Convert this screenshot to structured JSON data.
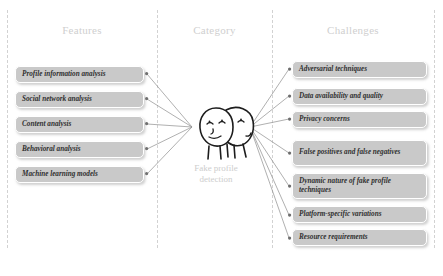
{
  "columns": [
    {
      "id": "features",
      "label": "Features"
    },
    {
      "id": "category",
      "label": "Category"
    },
    {
      "id": "challenges",
      "label": "Challenges"
    }
  ],
  "center": {
    "icon": "two-faces-mask-icon",
    "caption_line1": "Fake profile",
    "caption_line2": "detection",
    "caption": "Fake profile detection"
  },
  "features": [
    {
      "label": "Profile information analysis"
    },
    {
      "label": "Social network analysis"
    },
    {
      "label": "Content analysis"
    },
    {
      "label": "Behavioral analysis"
    },
    {
      "label": "Machine learning models"
    }
  ],
  "challenges": [
    {
      "label": "Adversarial techniques"
    },
    {
      "label": "Data availability and quality"
    },
    {
      "label": "Privacy concerns"
    },
    {
      "label": "False positives and false negatives"
    },
    {
      "label": "Dynamic nature of fake profile techniques"
    },
    {
      "label": "Platform-specific variations"
    },
    {
      "label": "Resource requirements"
    }
  ],
  "style": {
    "box_fill": "#c9c9c9",
    "box_border": "#ffffff",
    "header_text": "#cfcfcf",
    "caption_text": "#cdcdcd",
    "connector": "#8e8e8e",
    "divider": "#d2d2d2",
    "background": "#ffffff",
    "node_text": "#2f2f2f"
  }
}
